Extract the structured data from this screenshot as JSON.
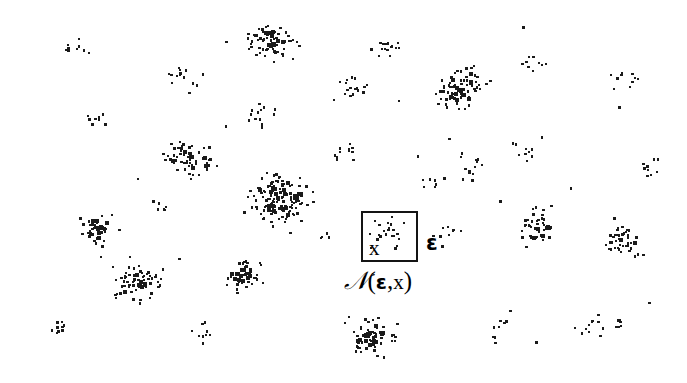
{
  "figure": {
    "width": 687,
    "height": 383,
    "background_color": "#ffffff",
    "dot_color": "#1a1a1a",
    "box_border_color": "#141414"
  },
  "annotations": {
    "point_label": "x",
    "epsilon_label": "ε",
    "neighborhood_label": {
      "script_n": "N",
      "open_paren": "(",
      "epsilon": "ε",
      "comma": ",",
      "variable": "x",
      "close_paren": ")",
      "full_text": "ℕ(ε,x)"
    }
  },
  "neighborhood_box": {
    "x": 361,
    "y": 211,
    "width": 57,
    "height": 51,
    "border_width": 2
  },
  "chart_data": {
    "type": "scatter",
    "title": "",
    "xlabel": "",
    "ylabel": "",
    "xlim": [
      0,
      687
    ],
    "ylim": [
      0,
      383
    ],
    "grid": false,
    "legend": null,
    "dot_size_px": 2.4,
    "clusters": [
      {
        "name": "c01",
        "cx": 78,
        "cy": 48,
        "rx": 22,
        "ry": 18,
        "n": 9,
        "density": "sparse",
        "seed": 101
      },
      {
        "name": "c02",
        "cx": 96,
        "cy": 122,
        "rx": 20,
        "ry": 16,
        "n": 9,
        "density": "sparse",
        "seed": 102
      },
      {
        "name": "c03",
        "cx": 185,
        "cy": 78,
        "rx": 23,
        "ry": 19,
        "n": 14,
        "density": "medium",
        "seed": 103
      },
      {
        "name": "c04",
        "cx": 190,
        "cy": 160,
        "rx": 32,
        "ry": 26,
        "n": 60,
        "density": "dense",
        "seed": 104
      },
      {
        "name": "c05",
        "cx": 272,
        "cy": 42,
        "rx": 32,
        "ry": 24,
        "n": 72,
        "density": "dense",
        "seed": 105
      },
      {
        "name": "c06",
        "cx": 260,
        "cy": 115,
        "rx": 22,
        "ry": 20,
        "n": 13,
        "density": "sparse",
        "seed": 106
      },
      {
        "name": "c07",
        "cx": 279,
        "cy": 198,
        "rx": 38,
        "ry": 34,
        "n": 150,
        "density": "very-dense",
        "seed": 107
      },
      {
        "name": "c08",
        "cx": 352,
        "cy": 92,
        "rx": 21,
        "ry": 20,
        "n": 18,
        "density": "medium",
        "seed": 108
      },
      {
        "name": "c09",
        "cx": 345,
        "cy": 150,
        "rx": 19,
        "ry": 17,
        "n": 11,
        "density": "sparse",
        "seed": 109
      },
      {
        "name": "c10",
        "cx": 385,
        "cy": 48,
        "rx": 20,
        "ry": 18,
        "n": 16,
        "density": "medium",
        "seed": 110
      },
      {
        "name": "c11",
        "cx": 386,
        "cy": 236,
        "rx": 19,
        "ry": 16,
        "n": 9,
        "density": "sparse",
        "seed": 111
      },
      {
        "name": "c12",
        "cx": 444,
        "cy": 236,
        "rx": 21,
        "ry": 17,
        "n": 10,
        "density": "sparse",
        "seed": 112
      },
      {
        "name": "c13",
        "cx": 462,
        "cy": 88,
        "rx": 34,
        "ry": 26,
        "n": 78,
        "density": "dense",
        "seed": 113,
        "angle": -32
      },
      {
        "name": "c14",
        "cx": 470,
        "cy": 168,
        "rx": 23,
        "ry": 20,
        "n": 13,
        "density": "sparse",
        "seed": 114
      },
      {
        "name": "c15",
        "cx": 434,
        "cy": 178,
        "rx": 16,
        "ry": 14,
        "n": 7,
        "density": "sparse",
        "seed": 115
      },
      {
        "name": "c16",
        "cx": 533,
        "cy": 60,
        "rx": 20,
        "ry": 17,
        "n": 9,
        "density": "sparse",
        "seed": 116
      },
      {
        "name": "c17",
        "cx": 528,
        "cy": 150,
        "rx": 20,
        "ry": 17,
        "n": 10,
        "density": "sparse",
        "seed": 117
      },
      {
        "name": "c18",
        "cx": 536,
        "cy": 224,
        "rx": 28,
        "ry": 27,
        "n": 42,
        "density": "dense",
        "seed": 118
      },
      {
        "name": "c19",
        "cx": 625,
        "cy": 75,
        "rx": 20,
        "ry": 18,
        "n": 10,
        "density": "sparse",
        "seed": 119
      },
      {
        "name": "c20",
        "cx": 622,
        "cy": 242,
        "rx": 28,
        "ry": 22,
        "n": 46,
        "density": "dense",
        "seed": 120
      },
      {
        "name": "c21",
        "cx": 650,
        "cy": 168,
        "rx": 18,
        "ry": 16,
        "n": 9,
        "density": "sparse",
        "seed": 121
      },
      {
        "name": "c22",
        "cx": 98,
        "cy": 228,
        "rx": 24,
        "ry": 24,
        "n": 44,
        "density": "dense",
        "seed": 122
      },
      {
        "name": "c23",
        "cx": 136,
        "cy": 283,
        "rx": 36,
        "ry": 26,
        "n": 70,
        "density": "dense",
        "seed": 123
      },
      {
        "name": "c24",
        "cx": 243,
        "cy": 277,
        "rx": 26,
        "ry": 22,
        "n": 52,
        "density": "dense",
        "seed": 124
      },
      {
        "name": "c25",
        "cx": 200,
        "cy": 333,
        "rx": 17,
        "ry": 15,
        "n": 9,
        "density": "sparse",
        "seed": 125
      },
      {
        "name": "c26",
        "cx": 372,
        "cy": 338,
        "rx": 30,
        "ry": 25,
        "n": 66,
        "density": "dense",
        "seed": 126
      },
      {
        "name": "c27",
        "cx": 500,
        "cy": 330,
        "rx": 19,
        "ry": 16,
        "n": 9,
        "density": "sparse",
        "seed": 127
      },
      {
        "name": "c28",
        "cx": 590,
        "cy": 330,
        "rx": 20,
        "ry": 17,
        "n": 10,
        "density": "sparse",
        "seed": 128
      },
      {
        "name": "c29",
        "cx": 60,
        "cy": 330,
        "rx": 17,
        "ry": 14,
        "n": 8,
        "density": "sparse",
        "seed": 129
      },
      {
        "name": "c30",
        "cx": 160,
        "cy": 208,
        "rx": 14,
        "ry": 12,
        "n": 6,
        "density": "sparse",
        "seed": 130
      },
      {
        "name": "c31",
        "cx": 620,
        "cy": 325,
        "rx": 16,
        "ry": 13,
        "n": 6,
        "density": "sparse",
        "seed": 131
      },
      {
        "name": "c32",
        "cx": 325,
        "cy": 236,
        "rx": 14,
        "ry": 12,
        "n": 5,
        "density": "sparse",
        "seed": 132
      },
      {
        "name": "c33",
        "cx": 388,
        "cy": 228,
        "rx": 16,
        "ry": 14,
        "n": 7,
        "density": "sparse",
        "seed": 133
      }
    ],
    "box_points": {
      "description": "Points that fall inside the epsilon-neighborhood box plus the centre point x",
      "values": [
        {
          "x": 375,
          "y": 221
        },
        {
          "x": 392,
          "y": 217
        },
        {
          "x": 404,
          "y": 223
        },
        {
          "x": 384,
          "y": 231
        },
        {
          "x": 370,
          "y": 234
        },
        {
          "x": 399,
          "y": 239
        },
        {
          "x": 397,
          "y": 246
        },
        {
          "x": 371,
          "y": 248
        }
      ]
    },
    "scattered_noise": {
      "count": 26,
      "description": "Isolated background points scattered between clusters"
    }
  }
}
